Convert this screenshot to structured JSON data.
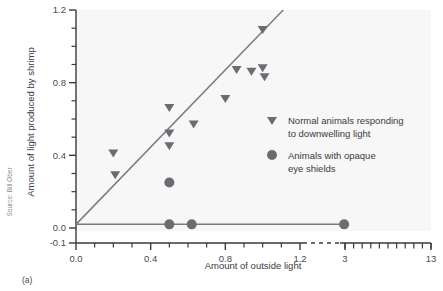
{
  "figure": {
    "panel_label": "(a)",
    "source": "Source: Bill Ober",
    "background_color": "#f7f7f7",
    "marker_color": "#6b6b73",
    "line_color": "#7b7b83",
    "axis_color": "#3a3a3e"
  },
  "chart_data": {
    "type": "scatter",
    "title": "",
    "xlabel": "Amount of outside light",
    "ylabel": "Amount of light produced by shrimp",
    "xlim": [
      -0.05,
      13.6
    ],
    "ylim": [
      -0.1,
      1.2
    ],
    "grid": false,
    "legend_position": "right-inner",
    "x_ticks_labeled": [
      "0.0",
      "0.4",
      "0.8",
      "1.2",
      "3",
      "13"
    ],
    "x_tick_values": [
      0.0,
      0.4,
      0.8,
      1.2,
      3,
      13
    ],
    "x_minor_tick_values": [
      0.1,
      0.2,
      0.3,
      0.5,
      0.6,
      0.7,
      0.9,
      1.0,
      1.1
    ],
    "x_right_minor_tick_values": [
      3,
      4,
      5,
      6,
      7,
      8,
      9,
      10,
      11,
      12,
      13
    ],
    "axis_break": true,
    "axis_break_note": "dashed break between 1.2 and 3",
    "y_ticks_labeled": [
      "-0.1",
      "0.0",
      "0.4",
      "0.8",
      "1.2"
    ],
    "y_tick_values": [
      -0.1,
      0.0,
      0.4,
      0.8,
      1.2
    ],
    "y_minor_tick_values": [
      0.1,
      0.2,
      0.3,
      0.5,
      0.6,
      0.7,
      0.9,
      1.0,
      1.1
    ],
    "series": [
      {
        "name": "Normal animals responding to downwelling light",
        "marker": "triangle-down",
        "color": "#6b6b73",
        "points": [
          [
            0.2,
            0.41
          ],
          [
            0.21,
            0.29
          ],
          [
            0.5,
            0.66
          ],
          [
            0.5,
            0.52
          ],
          [
            0.5,
            0.45
          ],
          [
            0.63,
            0.57
          ],
          [
            0.8,
            0.71
          ],
          [
            0.86,
            0.87
          ],
          [
            0.94,
            0.86
          ],
          [
            1.0,
            1.09
          ],
          [
            1.0,
            0.88
          ],
          [
            1.01,
            0.83
          ]
        ]
      },
      {
        "name": "Animals with opaque eye shields",
        "marker": "circle",
        "color": "#6b6b73",
        "points": [
          [
            0.5,
            0.25
          ],
          [
            0.5,
            0.02
          ],
          [
            0.62,
            0.02
          ],
          [
            2.9,
            0.02
          ]
        ]
      }
    ],
    "lines": [
      {
        "name": "regression-line-normal",
        "color": "#7b7b83",
        "from": [
          0.0,
          0.02
        ],
        "to": [
          1.11,
          1.2
        ]
      },
      {
        "name": "flat-line-shielded",
        "color": "#7b7b83",
        "from": [
          0.0,
          0.02
        ],
        "to": [
          2.9,
          0.02
        ]
      }
    ]
  },
  "legend": {
    "items": [
      {
        "marker": "triangle-down",
        "line1": "Normal animals responding",
        "line2": "to downwelling light"
      },
      {
        "marker": "circle",
        "line1": "Animals with opaque",
        "line2": "eye shields"
      }
    ]
  }
}
